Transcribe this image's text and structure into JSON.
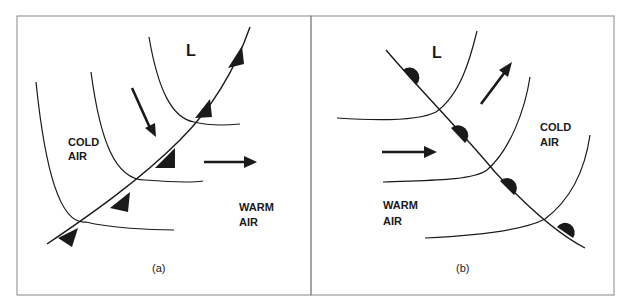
{
  "figure": {
    "panel_a": {
      "caption": "(a)",
      "low_label": "L",
      "cold_label_line1": "COLD",
      "cold_label_line2": "AIR",
      "warm_label_line1": "WARM",
      "warm_label_line2": "AIR",
      "front_type": "cold front",
      "front_symbol": "triangles"
    },
    "panel_b": {
      "caption": "(b)",
      "low_label": "L",
      "cold_label_line1": "COLD",
      "cold_label_line2": "AIR",
      "warm_label_line1": "WARM",
      "warm_label_line2": "AIR",
      "front_type": "warm front",
      "front_symbol": "semicircles"
    },
    "colors": {
      "ink": "#1a1a1a",
      "border": "#888888",
      "background": "#ffffff"
    }
  }
}
